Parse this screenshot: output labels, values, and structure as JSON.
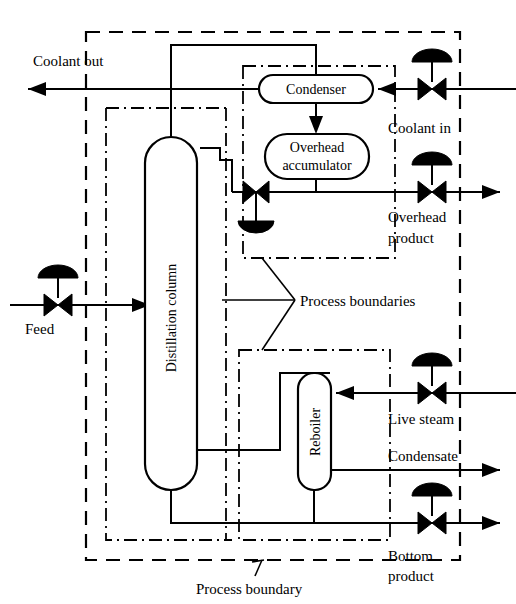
{
  "diagram": {
    "type": "process-flow-diagram"
  },
  "equipment": [
    {
      "id": "condenser",
      "label": "Condenser",
      "shape": "stadium-horizontal"
    },
    {
      "id": "overhead-accumulator",
      "label": "Overhead\naccumulator",
      "line1": "Overhead",
      "line2": "accumulator",
      "shape": "stadium-horizontal"
    },
    {
      "id": "distillation-column",
      "label": "Distillation column",
      "shape": "capsule-vertical",
      "orientation": "vertical-text"
    },
    {
      "id": "reboiler",
      "label": "Reboiler",
      "shape": "capsule-vertical",
      "orientation": "vertical-text"
    }
  ],
  "streams": [
    {
      "id": "coolant-out",
      "label": "Coolant out",
      "direction": "left"
    },
    {
      "id": "coolant-in",
      "label": "Coolant in",
      "direction": "left"
    },
    {
      "id": "overhead-product",
      "label_line1": "Overhead",
      "label_line2": "product",
      "direction": "right"
    },
    {
      "id": "feed",
      "label": "Feed",
      "direction": "right"
    },
    {
      "id": "live-steam",
      "label": "Live steam",
      "direction": "left"
    },
    {
      "id": "condensate",
      "label": "Condensate",
      "direction": "right"
    },
    {
      "id": "bottom-product",
      "label_line1": "Bottom",
      "label_line2": "product",
      "direction": "right"
    }
  ],
  "annotations": {
    "process_boundaries": "Process boundaries",
    "process_boundary": "Process boundary"
  },
  "valves": [
    {
      "id": "coolant-in-valve",
      "actuator": "diaphragm-top"
    },
    {
      "id": "overhead-product-valve",
      "actuator": "diaphragm-top"
    },
    {
      "id": "reflux-valve",
      "actuator": "diaphragm-bottom"
    },
    {
      "id": "feed-valve",
      "actuator": "diaphragm-top"
    },
    {
      "id": "live-steam-valve",
      "actuator": "diaphragm-top"
    },
    {
      "id": "bottom-product-valve",
      "actuator": "diaphragm-top"
    }
  ],
  "colors": {
    "line": "#000000",
    "background": "#ffffff"
  }
}
